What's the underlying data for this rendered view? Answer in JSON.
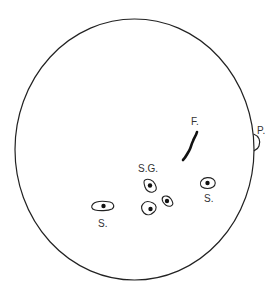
{
  "diagram": {
    "colors": {
      "stroke": "#222222",
      "label": "#333333",
      "background": "#ffffff"
    },
    "labels": {
      "filament": "F.",
      "prominence": "P.",
      "sunspot_group": "S.G.",
      "sunspot_right": "S.",
      "sunspot_left": "S."
    },
    "features": [
      {
        "id": "filament",
        "label": "F.",
        "meaning": "Filament"
      },
      {
        "id": "prominence",
        "label": "P.",
        "meaning": "Prominence"
      },
      {
        "id": "sunspot-group",
        "label": "S.G.",
        "meaning": "Sunspot group",
        "spot_count": 3
      },
      {
        "id": "sunspot-right",
        "label": "S.",
        "meaning": "Sunspot"
      },
      {
        "id": "sunspot-left",
        "label": "S.",
        "meaning": "Sunspot"
      }
    ]
  }
}
